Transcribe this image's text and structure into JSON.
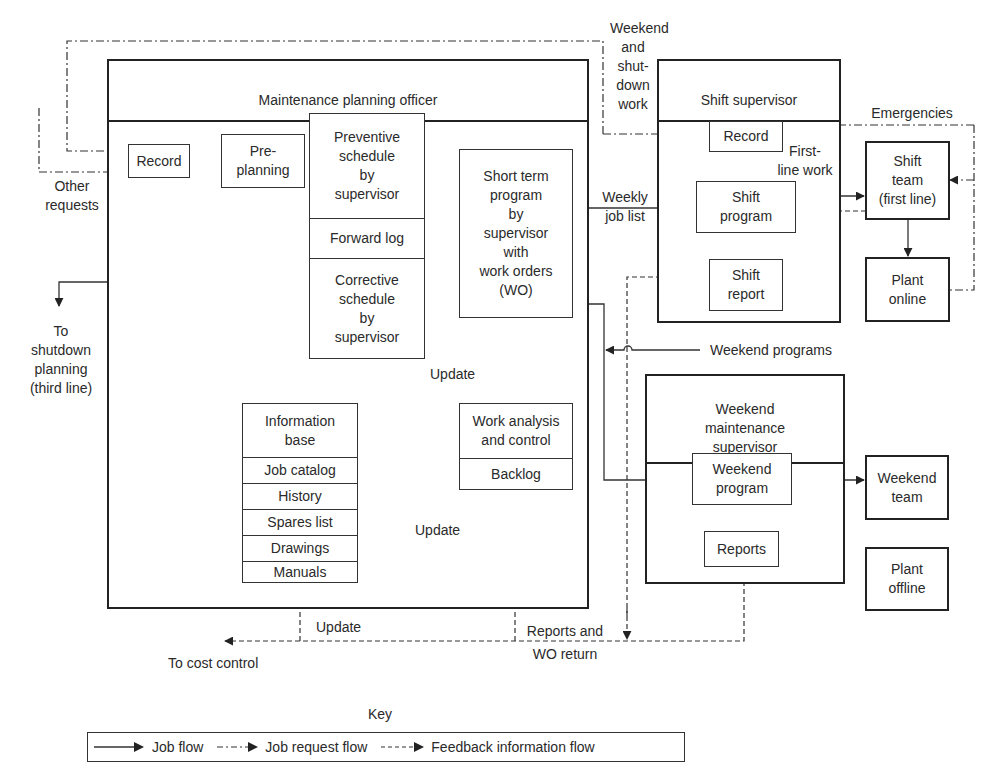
{
  "diagram": {
    "containers": {
      "planning_officer": "Maintenance planning officer",
      "shift_supervisor": "Shift supervisor",
      "weekend_supervisor": "Weekend\nmaintenance\nsupervisor"
    },
    "boxes": {
      "record_left": "Record",
      "pre_planning": "Pre-\nplanning",
      "preventive": "Preventive\nschedule\nby\nsupervisor",
      "forward_log": "Forward log",
      "corrective": "Corrective\nschedule\nby\nsupervisor",
      "short_term": "Short term\nprogram\nby\nsupervisor\nwith\nwork orders\n(WO)",
      "info_base": "Information\nbase",
      "info_items": [
        "Job catalog",
        "History",
        "Spares list",
        "Drawings",
        "Manuals"
      ],
      "work_analysis": "Work analysis\nand control",
      "backlog": "Backlog",
      "record_shift": "Record",
      "shift_program": "Shift\nprogram",
      "shift_report": "Shift\nreport",
      "shift_team": "Shift\nteam\n(first line)",
      "plant_online": "Plant\nonline",
      "weekend_program": "Weekend\nprogram",
      "reports": "Reports",
      "weekend_team": "Weekend\nteam",
      "plant_offline": "Plant\noffline"
    },
    "labels": {
      "other_requests": "Other\nrequests",
      "to_shutdown": "To\nshutdown\nplanning\n(third line)",
      "weekend_shutdown_work": "Weekend\nand\nshut-\ndown\nwork",
      "emergencies": "Emergencies",
      "first_line_work": "First-\nline work",
      "weekly_job_list": "Weekly\njob list",
      "weekend_programs": "Weekend programs",
      "update_top": "Update",
      "update_mid": "Update",
      "update_bottom": "Update",
      "to_cost_control": "To cost control",
      "reports_wo_return": "Reports and\nWO return"
    },
    "key": {
      "title": "Key",
      "job_flow": "Job flow",
      "job_request_flow": "Job request flow",
      "feedback_flow": "Feedback information flow"
    },
    "colors": {
      "line": "#222222",
      "text": "#2a2a2a",
      "background": "#ffffff"
    }
  }
}
